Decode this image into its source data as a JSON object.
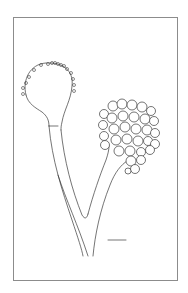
{
  "figure": {
    "background": "#ffffff",
    "ink_color": "#3a3a3a",
    "frame": {
      "x": 13.5,
      "y": 17.5,
      "width": 164,
      "height": 263,
      "color": "#8c8c8c"
    },
    "left_head": {
      "type": "vesicle-with-sterigmata",
      "center": [
        48,
        85
      ],
      "sterigmata_count": 17
    },
    "right_head": {
      "type": "spore-cluster",
      "spore_radius": 5,
      "spore_count": 34
    },
    "scale_bar": {
      "x1": 108,
      "y1": 240,
      "x2": 126,
      "y2": 240
    }
  }
}
